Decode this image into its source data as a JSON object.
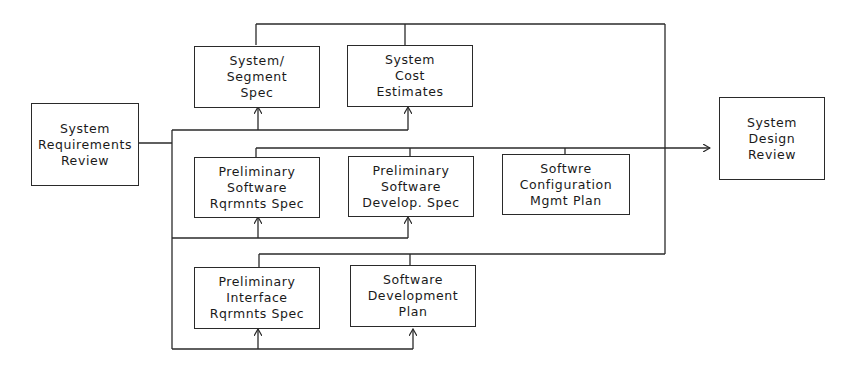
{
  "diagram": {
    "type": "flow",
    "nodes": {
      "srr": {
        "label": "System\nRequirements\nReview"
      },
      "sss": {
        "label": "System/\nSegment\nSpec"
      },
      "sce": {
        "label": "System\nCost\nEstimates"
      },
      "psrs": {
        "label": "Preliminary\nSoftware\nRqrmnts Spec"
      },
      "psds": {
        "label": "Preliminary\nSoftware\nDevelop. Spec"
      },
      "scmp": {
        "label": "Softwre\nConfiguration\nMgmt Plan"
      },
      "pirs": {
        "label": "Preliminary\nInterface\nRqrmnts Spec"
      },
      "sdp": {
        "label": "Software\nDevelopment\nPlan"
      },
      "sdr": {
        "label": "System\nDesign\nReview"
      }
    },
    "edges": [
      {
        "from": "srr",
        "to": "sss"
      },
      {
        "from": "srr",
        "to": "sce"
      },
      {
        "from": "srr",
        "to": "psrs"
      },
      {
        "from": "srr",
        "to": "psds"
      },
      {
        "from": "srr",
        "to": "pirs"
      },
      {
        "from": "srr",
        "to": "sdp"
      },
      {
        "from": "sss",
        "to": "sdr"
      },
      {
        "from": "sce",
        "to": "sdr"
      },
      {
        "from": "psrs",
        "to": "sdr"
      },
      {
        "from": "psds",
        "to": "sdr"
      },
      {
        "from": "scmp",
        "to": "sdr"
      },
      {
        "from": "pirs",
        "to": "sdr"
      },
      {
        "from": "sdp",
        "to": "sdr"
      }
    ],
    "colors": {
      "line": "#2a2a2a",
      "background": "#ffffff"
    }
  }
}
